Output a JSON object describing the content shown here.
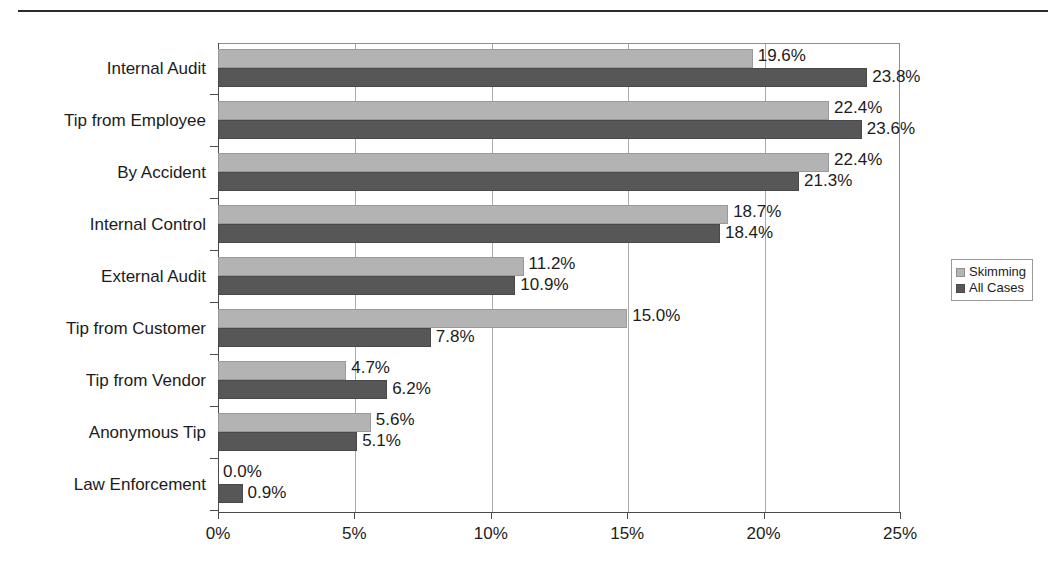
{
  "chart_data": {
    "type": "bar",
    "orientation": "horizontal",
    "title": "",
    "subtitle": "",
    "xlabel": "",
    "ylabel": "",
    "xlim": [
      0,
      25
    ],
    "xtick_labels": [
      "0%",
      "5%",
      "10%",
      "15%",
      "20%",
      "25%"
    ],
    "xtick_values": [
      0,
      5,
      10,
      15,
      20,
      25
    ],
    "grid": true,
    "grid_axis": "x",
    "legend_position": "right",
    "categories": [
      "Internal Audit",
      "Tip from Employee",
      "By Accident",
      "Internal Control",
      "External Audit",
      "Tip from Customer",
      "Tip from Vendor",
      "Anonymous Tip",
      "Law Enforcement"
    ],
    "series": [
      {
        "name": "Skimming",
        "color": "#b3b3b3",
        "values": [
          19.6,
          22.4,
          22.4,
          18.7,
          11.2,
          15.0,
          4.7,
          5.6,
          0.0
        ],
        "labels": [
          "19.6%",
          "22.4%",
          "22.4%",
          "18.7%",
          "11.2%",
          "15.0%",
          "4.7%",
          "5.6%",
          "0.0%"
        ]
      },
      {
        "name": "All Cases",
        "color": "#575757",
        "values": [
          23.8,
          23.6,
          21.3,
          18.4,
          10.9,
          7.8,
          6.2,
          5.1,
          0.9
        ],
        "labels": [
          "23.8%",
          "23.6%",
          "21.3%",
          "18.4%",
          "10.9%",
          "7.8%",
          "6.2%",
          "5.1%",
          "0.9%"
        ]
      }
    ]
  },
  "legend": {
    "items": [
      {
        "label": "Skimming",
        "color": "#b3b3b3"
      },
      {
        "label": "All Cases",
        "color": "#575757"
      }
    ]
  }
}
